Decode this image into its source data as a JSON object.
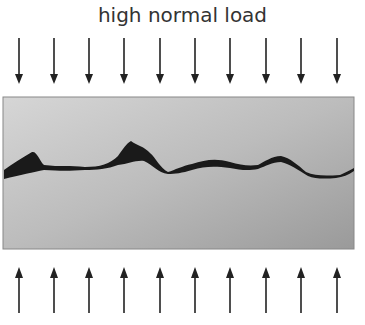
{
  "title": "high normal load",
  "arrows": {
    "count": 10,
    "x_positions": [
      19,
      54,
      89,
      124,
      160,
      195,
      230,
      266,
      301,
      337
    ],
    "top_direction": "down",
    "bottom_direction": "up"
  },
  "block": {
    "x": 3,
    "y": 97,
    "width": 351,
    "height": 152
  },
  "colors": {
    "block_light": "#cfcfcf",
    "block_dark": "#9a9a9a",
    "gap": "#1a1a1a",
    "arrow": "#222222",
    "text": "#333333"
  }
}
